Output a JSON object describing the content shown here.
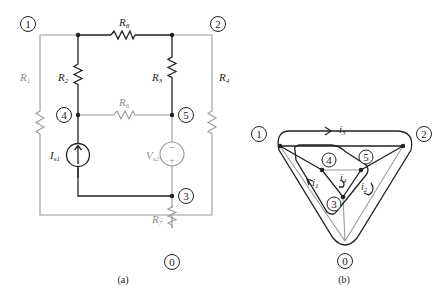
{
  "figure_a": {
    "caption": "(a)",
    "nodes": [
      "1",
      "2",
      "4",
      "5",
      "3",
      "0"
    ],
    "components": {
      "R8": "R",
      "R8_sub": "8",
      "R1": "R",
      "R1_sub": "1",
      "R2": "R",
      "R2_sub": "2",
      "R3": "R",
      "R3_sub": "3",
      "R4": "R",
      "R4_sub": "4",
      "R6": "R",
      "R6_sub": "6",
      "R7": "R",
      "R7_sub": "7",
      "Is1": "I",
      "Is1_sub": "s1",
      "Vs2": "V",
      "Vs2_sub": "s2",
      "minus": "−",
      "plus": "+"
    }
  },
  "figure_b": {
    "caption": "(b)",
    "nodes": [
      "1",
      "2",
      "4",
      "5",
      "3",
      "0"
    ],
    "loops": {
      "i1": "i",
      "i1_sub": "1",
      "i2": "i",
      "i2_sub": "2",
      "i3": "i",
      "i3_sub": "3",
      "i4": "i",
      "i4_sub": "4"
    }
  },
  "colors": {
    "dark": "#222222",
    "gray": "#9a9a9a"
  }
}
